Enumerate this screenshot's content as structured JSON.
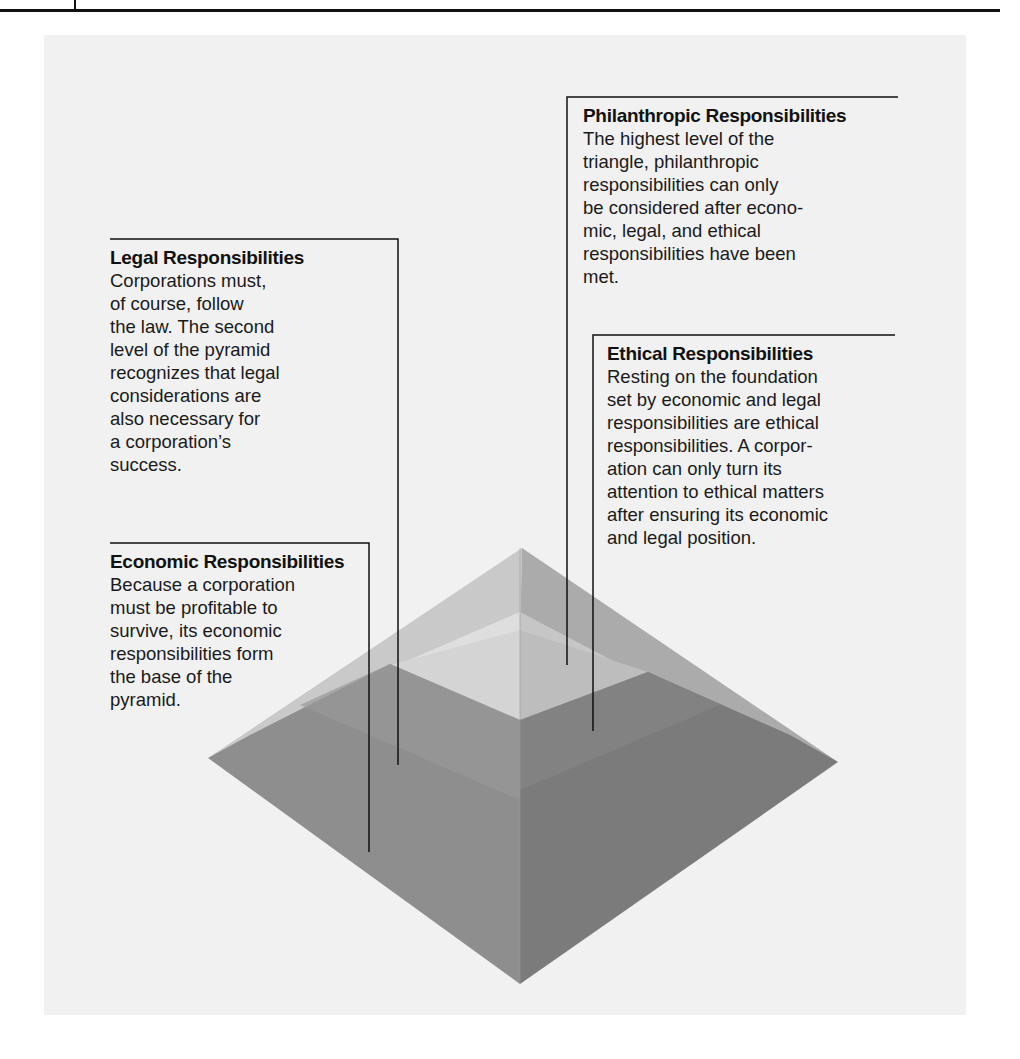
{
  "figure": {
    "type": "pyramid-diagram",
    "colors": {
      "panel_background": "#f1f1f1",
      "top_left_face": "#c9c9c9",
      "top_right_face": "#a9a9a9",
      "upper_band_left": "#dedede",
      "upper_band_right": "#c2c2c2",
      "inner_left": "#d2d2d2",
      "inner_right": "#bcbcbc",
      "lower_left_face": "#8d8d8d",
      "lower_right_face": "#7a7a7a",
      "callout_line": "#111111"
    }
  },
  "callouts": {
    "philanthropic": {
      "title": "Philanthropic Responsibilities",
      "body": "The highest level of the\ntriangle, philanthropic\nresponsibilities can only\nbe considered after econo-\nmic, legal, and ethical\nresponsibilities have been\nmet."
    },
    "legal": {
      "title": "Legal Responsibilities",
      "body": "Corporations must,\nof course, follow\nthe law. The second\nlevel of the pyramid\nrecognizes that legal\nconsiderations are\nalso necessary for\na corporation’s\nsuccess."
    },
    "ethical": {
      "title": "Ethical Responsibilities",
      "body": "Resting on the foundation\nset by economic and legal\nresponsibilities are ethical\nresponsibilities. A corpor-\nation can only turn its\nattention to ethical matters\nafter ensuring its economic\nand legal position."
    },
    "economic": {
      "title": "Economic Responsibilities",
      "body": "Because a corporation\nmust be profitable to\nsurvive, its economic\nresponsibilities form\nthe base of the\npyramid."
    }
  }
}
